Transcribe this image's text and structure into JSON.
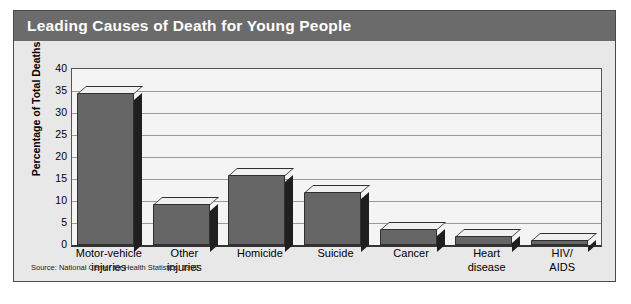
{
  "figure": {
    "title": "Leading Causes of Death for Young People",
    "source": "Source: National Center for Health Statistics, 1992",
    "title_bar_color": "#6b6b6b",
    "panel_color": "#e8e8e8",
    "plot_color": "#f4f4f4",
    "bar_face_color": "#666666",
    "bar_side_color": "#1f1f1f",
    "bar_top_color": "#f0f0f0"
  },
  "chart_data": {
    "type": "bar",
    "title": "Leading Causes of Death for Young People",
    "xlabel": "",
    "ylabel": "Percentage of Total Deaths",
    "ylim": [
      0,
      40
    ],
    "yticks": [
      0,
      5,
      10,
      15,
      20,
      25,
      30,
      35,
      40
    ],
    "grid": true,
    "legend": "none",
    "categories": [
      "Motor-vehicle injuries",
      "Other injuries",
      "Homicide",
      "Suicide",
      "Cancer",
      "Heart disease",
      "HIV/ AIDS"
    ],
    "category_lines": [
      [
        "Motor-vehicle",
        "injuries"
      ],
      [
        "Other",
        "injuries"
      ],
      [
        "Homicide"
      ],
      [
        "Suicide"
      ],
      [
        "Cancer"
      ],
      [
        "Heart",
        "disease"
      ],
      [
        "HIV/",
        "AIDS"
      ]
    ],
    "values": [
      34.5,
      9.3,
      15.8,
      12.0,
      3.6,
      2.0,
      1.2
    ],
    "annotations": [
      "Source: National Center for Health Statistics, 1992"
    ]
  }
}
